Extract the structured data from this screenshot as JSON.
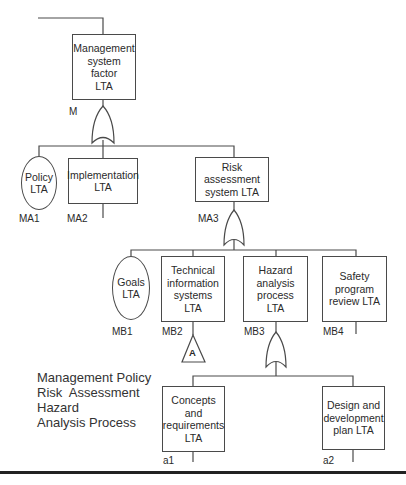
{
  "diagram": {
    "type": "fault-tree",
    "nodes": {
      "M": {
        "id": "M",
        "label": "Management system factor LTA",
        "lines": [
          "Management",
          "system",
          "factor",
          "LTA"
        ],
        "shape": "rectangle",
        "gate": "OR"
      },
      "MA1": {
        "id": "MA1",
        "label": "Policy LTA",
        "lines": [
          "Policy",
          "LTA"
        ],
        "shape": "ellipse"
      },
      "MA2": {
        "id": "MA2",
        "label": "Implementation LTA",
        "lines": [
          "Implementation",
          "LTA"
        ],
        "shape": "rectangle"
      },
      "MA3": {
        "id": "MA3",
        "label": "Risk assessment system LTA",
        "lines": [
          "Risk assessment",
          "system LTA"
        ],
        "shape": "rectangle",
        "gate": "OR"
      },
      "MB1": {
        "id": "MB1",
        "label": "Goals LTA",
        "lines": [
          "Goals",
          "LTA"
        ],
        "shape": "ellipse"
      },
      "MB2": {
        "id": "MB2",
        "label": "Technical information systems LTA",
        "lines": [
          "Technical",
          "information",
          "systems",
          "LTA"
        ],
        "shape": "rectangle",
        "transfer": "A"
      },
      "MB3": {
        "id": "MB3",
        "label": "Hazard analysis process LTA",
        "lines": [
          "Hazard",
          "analysis",
          "process",
          "LTA"
        ],
        "shape": "rectangle",
        "gate": "OR"
      },
      "MB4": {
        "id": "MB4",
        "label": "Safety program review LTA",
        "lines": [
          "Safety",
          "program",
          "review LTA"
        ],
        "shape": "rectangle"
      },
      "a1": {
        "id": "a1",
        "label": "Concepts and requirements LTA",
        "lines": [
          "Concepts and",
          "requirements",
          "LTA"
        ],
        "shape": "rectangle"
      },
      "a2": {
        "id": "a2",
        "label": "Design and development plan LTA",
        "lines": [
          "Design and",
          "development",
          "plan LTA"
        ],
        "shape": "rectangle"
      }
    },
    "edges": [
      [
        "M",
        "MA1"
      ],
      [
        "M",
        "MA2"
      ],
      [
        "M",
        "MA3"
      ],
      [
        "MA3",
        "MB1"
      ],
      [
        "MA3",
        "MB2"
      ],
      [
        "MA3",
        "MB3"
      ],
      [
        "MA3",
        "MB4"
      ],
      [
        "MB3",
        "a1"
      ],
      [
        "MB3",
        "a2"
      ]
    ],
    "transfer_symbol": "A",
    "legend": [
      "Management Policy",
      "Risk  Assessment",
      "Hazard",
      "Analysis Process"
    ]
  }
}
